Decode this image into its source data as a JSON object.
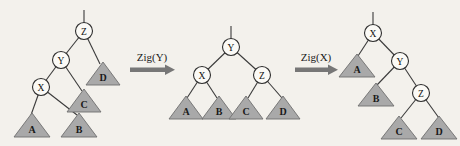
{
  "figure": {
    "background_color": "#f3f1ec",
    "node_fill": "#fbfaf6",
    "node_stroke": "#2e2e2e",
    "subtree_fill": "#a9a9a9",
    "subtree_stroke": "#6f6f6f",
    "arrow_color": "#777777",
    "width": 460,
    "height": 146
  },
  "trees": [
    {
      "id": "tree-before",
      "nodes": [
        {
          "label": "Z",
          "x": 84,
          "y": 31,
          "r": 8.5
        },
        {
          "label": "Y",
          "x": 61,
          "y": 60,
          "r": 8.5
        },
        {
          "label": "X",
          "x": 41,
          "y": 87,
          "r": 8.5
        }
      ],
      "subtrees": [
        {
          "label": "D",
          "cx": 103,
          "cy": 74
        },
        {
          "label": "C",
          "cx": 84,
          "cy": 101
        },
        {
          "label": "A",
          "cx": 32,
          "cy": 125
        },
        {
          "label": "B",
          "cx": 79,
          "cy": 125
        }
      ]
    },
    {
      "id": "tree-middle",
      "nodes": [
        {
          "label": "Y",
          "x": 231,
          "y": 47,
          "r": 8.5
        },
        {
          "label": "X",
          "x": 202,
          "y": 75,
          "r": 8.5
        },
        {
          "label": "Z",
          "x": 262,
          "y": 75,
          "r": 8.5
        }
      ],
      "subtrees": [
        {
          "label": "A",
          "cx": 186,
          "cy": 108
        },
        {
          "label": "B",
          "cx": 219,
          "cy": 108
        },
        {
          "label": "C",
          "cx": 246,
          "cy": 108
        },
        {
          "label": "D",
          "cx": 283,
          "cy": 108
        }
      ]
    },
    {
      "id": "tree-after",
      "nodes": [
        {
          "label": "X",
          "x": 373,
          "y": 33,
          "r": 8.5
        },
        {
          "label": "Y",
          "x": 400,
          "y": 61,
          "r": 8.5
        },
        {
          "label": "Z",
          "x": 421,
          "y": 93,
          "r": 8.5
        }
      ],
      "subtrees": [
        {
          "label": "A",
          "cx": 357,
          "cy": 66
        },
        {
          "label": "B",
          "cx": 376,
          "cy": 95
        },
        {
          "label": "C",
          "cx": 399,
          "cy": 128
        },
        {
          "label": "D",
          "cx": 439,
          "cy": 128
        }
      ]
    }
  ],
  "operations": [
    {
      "id": "op-zig-y",
      "label": "Zig(Y)",
      "label_x": 152,
      "label_y": 57,
      "arrow_x": 130,
      "arrow_y": 70,
      "arrow_w": 44
    },
    {
      "id": "op-zig-x",
      "label": "Zig(X)",
      "label_x": 316,
      "label_y": 57,
      "arrow_x": 295,
      "arrow_y": 70,
      "arrow_w": 44
    }
  ]
}
